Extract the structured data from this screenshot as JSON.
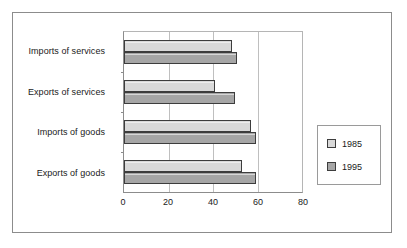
{
  "chart_data": {
    "type": "bar",
    "orientation": "horizontal",
    "title": "",
    "xlabel": "",
    "ylabel": "",
    "categories": [
      "Exports of goods",
      "Imports of goods",
      "Exports of services",
      "Imports of services"
    ],
    "categories_top_to_bottom": [
      "Imports of services",
      "Exports of services",
      "Imports of goods",
      "Exports of goods"
    ],
    "series": [
      {
        "name": "1985",
        "values": [
          53,
          57,
          41,
          48.5
        ],
        "color": "#d9d9d9"
      },
      {
        "name": "1995",
        "values": [
          59.5,
          59.5,
          50,
          51
        ],
        "color": "#a6a6a6"
      }
    ],
    "xlim": [
      0,
      80
    ],
    "xticks": [
      0,
      20,
      40,
      60,
      80
    ],
    "gridlines": [
      20,
      40,
      60
    ],
    "grid": true,
    "legend_position": "right"
  },
  "legend": {
    "items": [
      {
        "label": "1985"
      },
      {
        "label": "1995"
      }
    ]
  },
  "axis": {
    "ticks": [
      "0",
      "20",
      "40",
      "60",
      "80"
    ]
  },
  "caption": {
    "text": ""
  }
}
